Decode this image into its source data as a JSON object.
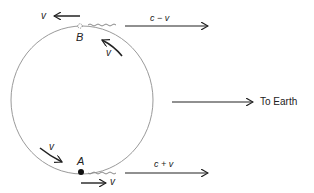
{
  "diagram": {
    "points": {
      "A": {
        "label": "A"
      },
      "B": {
        "label": "B"
      }
    },
    "velocity_labels": {
      "b_left": "v",
      "b_tangent": "v",
      "a_tangent": "v",
      "a_right": "v"
    },
    "signals": {
      "from_B": "c − v",
      "from_A": "c + v"
    },
    "direction_label": "To Earth",
    "colors": {
      "ink": "#222222",
      "circle": "#9a9a9a",
      "wave": "#8a8a8a"
    }
  }
}
